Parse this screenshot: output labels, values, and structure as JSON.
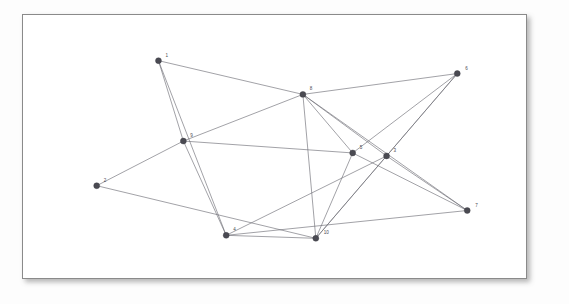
{
  "figure": {
    "kind": "node-link-graph",
    "background_color": "#ffffff",
    "frame_border_color": "#8a8a8a",
    "node_color": "#4a4a52",
    "edge_color": "#6e6e76",
    "label_color": "#4a4a52",
    "canvas": {
      "width": 505,
      "height": 265
    }
  },
  "graph": {
    "nodes": [
      {
        "id": "1",
        "label": "1",
        "x": 136,
        "y": 46,
        "r": 3.0,
        "lx": 143,
        "ly": 42
      },
      {
        "id": "6",
        "label": "6",
        "x": 436,
        "y": 59,
        "r": 3.0,
        "lx": 444,
        "ly": 55
      },
      {
        "id": "8",
        "label": "8",
        "x": 281,
        "y": 80,
        "r": 3.0,
        "lx": 288,
        "ly": 76
      },
      {
        "id": "9",
        "label": "9",
        "x": 161,
        "y": 127,
        "r": 3.0,
        "lx": 168,
        "ly": 123
      },
      {
        "id": "5",
        "label": "5",
        "x": 331,
        "y": 139,
        "r": 3.0,
        "lx": 338,
        "ly": 135
      },
      {
        "id": "3",
        "label": "3",
        "x": 365,
        "y": 142,
        "r": 3.0,
        "lx": 372,
        "ly": 138
      },
      {
        "id": "2",
        "label": "2",
        "x": 74,
        "y": 172,
        "r": 3.0,
        "lx": 81,
        "ly": 168
      },
      {
        "id": "7",
        "label": "7",
        "x": 446,
        "y": 197,
        "r": 3.0,
        "lx": 454,
        "ly": 193
      },
      {
        "id": "4",
        "label": "4",
        "x": 204,
        "y": 222,
        "r": 3.0,
        "lx": 211,
        "ly": 218
      },
      {
        "id": "10",
        "label": "10",
        "x": 294,
        "y": 225,
        "r": 3.0,
        "lx": 302,
        "ly": 221
      }
    ],
    "edges": [
      {
        "from": "1",
        "to": "8"
      },
      {
        "from": "1",
        "to": "9"
      },
      {
        "from": "1",
        "to": "4"
      },
      {
        "from": "9",
        "to": "2"
      },
      {
        "from": "9",
        "to": "8"
      },
      {
        "from": "9",
        "to": "5"
      },
      {
        "from": "9",
        "to": "4"
      },
      {
        "from": "2",
        "to": "10"
      },
      {
        "from": "8",
        "to": "6"
      },
      {
        "from": "8",
        "to": "5"
      },
      {
        "from": "8",
        "to": "3"
      },
      {
        "from": "8",
        "to": "10"
      },
      {
        "from": "8",
        "to": "7"
      },
      {
        "from": "6",
        "to": "5"
      },
      {
        "from": "6",
        "to": "3"
      },
      {
        "from": "6",
        "to": "10"
      },
      {
        "from": "5",
        "to": "7"
      },
      {
        "from": "5",
        "to": "10"
      },
      {
        "from": "3",
        "to": "7"
      },
      {
        "from": "3",
        "to": "10"
      },
      {
        "from": "4",
        "to": "10"
      },
      {
        "from": "4",
        "to": "7"
      },
      {
        "from": "4",
        "to": "3"
      }
    ]
  }
}
